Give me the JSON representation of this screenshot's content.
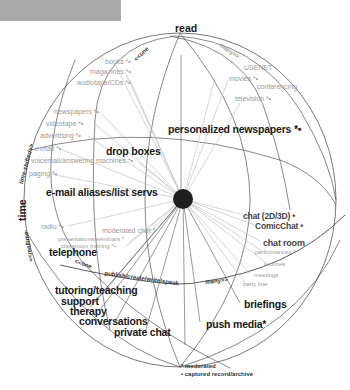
{
  "header_bar": {
    "color": "#a9a9a9"
  },
  "axes": {
    "top": "read",
    "left": "time",
    "left_upper": "time-shifted>>",
    "left_lower": "<<realtime",
    "arc_top_left": "<<one",
    "arc_top_right": "many>>",
    "arc_bottom_left": "<<one",
    "arc_bottom_mid": "publish/create/write/speak",
    "arc_bottom_right": "many>>"
  },
  "labels_gray": [
    {
      "text": "books *•"
    },
    {
      "text": "magazines *•"
    },
    {
      "text": "audiotape/CDs *•"
    },
    {
      "text": "USENET"
    },
    {
      "text": "movies *•"
    },
    {
      "text": "conferencing"
    },
    {
      "text": "television *•"
    },
    {
      "text": "newspapers *•"
    },
    {
      "text": "videotape *•"
    },
    {
      "text": "advertising *•"
    },
    {
      "text": "e-mail *•"
    },
    {
      "text": "voicemail/answering machines *•"
    },
    {
      "text": "paging *•"
    },
    {
      "text": "radio *•"
    },
    {
      "text": "moderated chat *"
    },
    {
      "text": "presentations/seminars *"
    },
    {
      "text": "classroom training *•"
    },
    {
      "text": "performances *"
    },
    {
      "text": "lectures"
    },
    {
      "text": "meetings"
    },
    {
      "text": "party line"
    }
  ],
  "labels_bold": [
    {
      "text": "drop boxes"
    },
    {
      "text": "personalized newspapers *•"
    },
    {
      "text": "e-mail aliases/list servs"
    },
    {
      "text": "chat (2D/3D) •"
    },
    {
      "text": "ComicChat •"
    },
    {
      "text": "chat room"
    },
    {
      "text": "telephone"
    },
    {
      "text": "tutoring/teaching"
    },
    {
      "text": "support"
    },
    {
      "text": "therapy"
    },
    {
      "text": "conversations"
    },
    {
      "text": "private chat"
    },
    {
      "text": "briefings"
    },
    {
      "text": "push media*"
    }
  ],
  "legend": {
    "moderated": "* moderated",
    "captured": "• captured record/archive"
  },
  "colors": {
    "line": "#555555",
    "spoke": "#b8b8b8",
    "hub": "#1f1f1f",
    "gray_text": "#9a9a9a"
  }
}
